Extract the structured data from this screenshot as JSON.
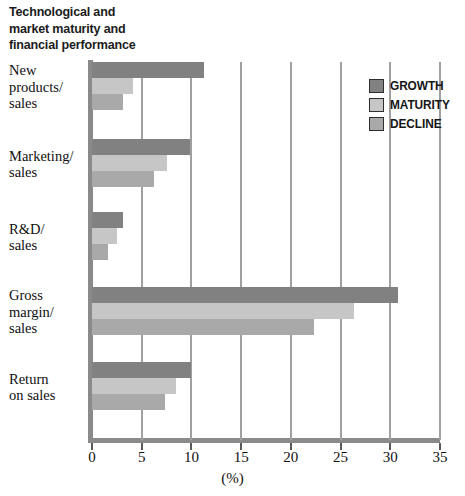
{
  "chart_data": {
    "type": "bar",
    "orientation": "horizontal",
    "title": "Technological and\nmarket maturity and\nfinancial performance",
    "xlabel": "(%)",
    "ylabel": "",
    "xlim": [
      0,
      35
    ],
    "xticks": [
      0,
      5,
      10,
      15,
      20,
      25,
      30,
      35
    ],
    "xtick_labels": [
      "0",
      "5",
      "10",
      "15",
      "20",
      "25",
      "30",
      "35"
    ],
    "grid": true,
    "grid_axis": "x",
    "legend_position": "top-right",
    "categories": [
      "New\nproducts/\nsales",
      "Marketing/\nsales",
      "R&D/\nsales",
      "Gross\nmargin/\nsales",
      "Return\non sales"
    ],
    "series": [
      {
        "name": "GROWTH",
        "color": "#818181",
        "values": [
          11.3,
          9.9,
          3.1,
          30.8,
          10.0
        ]
      },
      {
        "name": "MATURITY",
        "color": "#c6c6c6",
        "values": [
          4.1,
          7.5,
          2.5,
          26.4,
          8.4
        ]
      },
      {
        "name": "DECLINE",
        "color": "#a9a9a9",
        "values": [
          3.1,
          6.2,
          1.6,
          22.3,
          7.3
        ]
      }
    ]
  },
  "legend": {
    "items": [
      {
        "label": "GROWTH"
      },
      {
        "label": "MATURITY"
      },
      {
        "label": "DECLINE"
      }
    ]
  },
  "colors": {
    "growth": "#818181",
    "maturity": "#c6c6c6",
    "decline": "#a9a9a9",
    "axis": "#8a8a8a",
    "gridline": "#a0a0a0",
    "text": "#101010",
    "background": "#ffffff"
  }
}
